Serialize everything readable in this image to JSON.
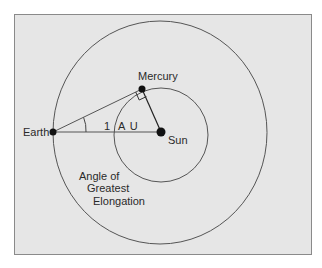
{
  "diagram": {
    "colors": {
      "background": "#e6e6e6",
      "frame_border": "#8a8a8a",
      "stroke": "#555555",
      "dot": "#111111",
      "text": "#2a2a2a"
    },
    "nodes": {
      "earth": {
        "label": "Earth"
      },
      "mercury": {
        "label": "Mercury"
      },
      "sun": {
        "label": "Sun"
      }
    },
    "distance_label": {
      "number": "1",
      "unit": "A U"
    },
    "caption": {
      "line1": "Angle of",
      "line2": "Greatest",
      "line3": "Elongation"
    },
    "orbits": [
      {
        "name": "Earth orbit"
      },
      {
        "name": "Mercury orbit"
      }
    ]
  }
}
